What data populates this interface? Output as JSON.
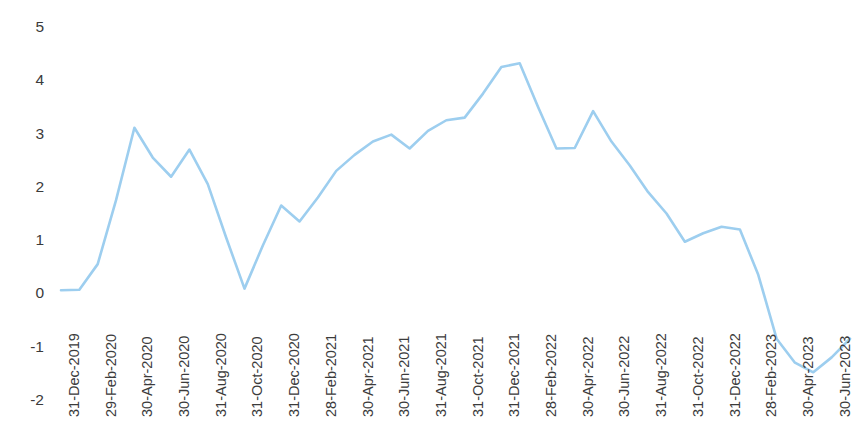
{
  "chart_data": {
    "type": "line",
    "title": "",
    "subtitle": "",
    "xlabel": "",
    "ylabel": "",
    "ylim": [
      -2,
      5
    ],
    "yticks": [
      5,
      4,
      3,
      2,
      1,
      0,
      -1,
      -2
    ],
    "ytick_labels": [
      "5",
      "4",
      "3",
      "2",
      "1",
      "0",
      "-1",
      "-2"
    ],
    "grid": false,
    "legend": null,
    "legend_position": "none",
    "series_color": "#9DCEEF",
    "line_width": 2.6,
    "xtick_labels": [
      "31-Dec-2019",
      "29-Feb-2020",
      "30-Apr-2020",
      "30-Jun-2020",
      "31-Aug-2020",
      "31-Oct-2020",
      "31-Dec-2020",
      "28-Feb-2021",
      "30-Apr-2021",
      "30-Jun-2021",
      "31-Aug-2021",
      "31-Oct-2021",
      "31-Dec-2021",
      "28-Feb-2022",
      "30-Apr-2022",
      "30-Jun-2022",
      "31-Aug-2022",
      "31-Oct-2022",
      "31-Dec-2022",
      "28-Feb-2023",
      "30-Apr-2023",
      "30-Jun-2023"
    ],
    "x": [
      "31-Dec-2019",
      "31-Jan-2020",
      "29-Feb-2020",
      "31-Mar-2020",
      "30-Apr-2020",
      "31-May-2020",
      "30-Jun-2020",
      "31-Jul-2020",
      "31-Aug-2020",
      "30-Sep-2020",
      "31-Oct-2020",
      "30-Nov-2020",
      "31-Dec-2020",
      "31-Jan-2021",
      "28-Feb-2021",
      "31-Mar-2021",
      "30-Apr-2021",
      "31-May-2021",
      "30-Jun-2021",
      "31-Jul-2021",
      "31-Aug-2021",
      "30-Sep-2021",
      "31-Oct-2021",
      "30-Nov-2021",
      "31-Dec-2021",
      "31-Jan-2022",
      "28-Feb-2022",
      "31-Mar-2022",
      "30-Apr-2022",
      "31-May-2022",
      "30-Jun-2022",
      "31-Jul-2022",
      "31-Aug-2022",
      "30-Sep-2022",
      "31-Oct-2022",
      "30-Nov-2022",
      "31-Dec-2022",
      "31-Jan-2023",
      "28-Feb-2023",
      "31-Mar-2023",
      "30-Apr-2023",
      "31-May-2023",
      "30-Jun-2023",
      "31-Jul-2023"
    ],
    "values": [
      0.06,
      0.07,
      0.55,
      1.75,
      3.11,
      2.55,
      2.19,
      2.7,
      2.05,
      1.05,
      0.09,
      0.9,
      1.65,
      1.35,
      1.8,
      2.3,
      2.6,
      2.85,
      2.98,
      2.72,
      3.05,
      3.25,
      3.3,
      3.75,
      4.25,
      4.32,
      3.5,
      2.72,
      2.73,
      3.42,
      2.85,
      2.4,
      1.9,
      1.5,
      0.97,
      1.13,
      1.25,
      1.2,
      0.35,
      -0.85,
      -1.3,
      -1.48,
      -1.2,
      -0.85
    ]
  }
}
